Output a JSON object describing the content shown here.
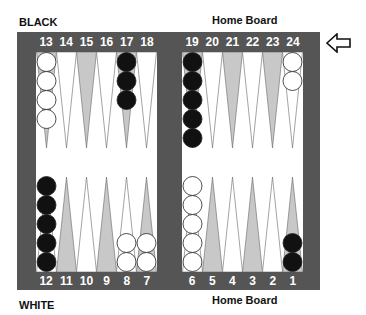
{
  "labels": {
    "top_left": "BLACK",
    "top_right": "Home Board",
    "bottom_left": "WHITE",
    "bottom_right": "Home Board"
  },
  "colors": {
    "frame": "#555555",
    "field": "#ffffff",
    "dark_point": "#c8c8c8",
    "light_point": "#ffffff",
    "black_checker": "#111111",
    "white_checker": "#ffffff"
  },
  "direction_arrow": "left-arrow-icon",
  "top_left_numbers": [
    "13",
    "14",
    "15",
    "16",
    "17",
    "18"
  ],
  "top_right_numbers": [
    "19",
    "20",
    "21",
    "22",
    "23",
    "24"
  ],
  "bottom_left_numbers": [
    "12",
    "11",
    "10",
    "9",
    "8",
    "7"
  ],
  "bottom_right_numbers": [
    "6",
    "5",
    "4",
    "3",
    "2",
    "1"
  ],
  "points": {
    "13": {
      "color": "white",
      "count": 4,
      "shade": "dark"
    },
    "14": {
      "color": null,
      "count": 0,
      "shade": "light"
    },
    "15": {
      "color": null,
      "count": 0,
      "shade": "dark"
    },
    "16": {
      "color": null,
      "count": 0,
      "shade": "light"
    },
    "17": {
      "color": "black",
      "count": 3,
      "shade": "dark"
    },
    "18": {
      "color": null,
      "count": 0,
      "shade": "light"
    },
    "19": {
      "color": "black",
      "count": 5,
      "shade": "dark"
    },
    "20": {
      "color": null,
      "count": 0,
      "shade": "light"
    },
    "21": {
      "color": null,
      "count": 0,
      "shade": "dark"
    },
    "22": {
      "color": null,
      "count": 0,
      "shade": "light"
    },
    "23": {
      "color": null,
      "count": 0,
      "shade": "dark"
    },
    "24": {
      "color": "white",
      "count": 2,
      "shade": "light"
    },
    "12": {
      "color": "black",
      "count": 5,
      "shade": "light"
    },
    "11": {
      "color": null,
      "count": 0,
      "shade": "dark"
    },
    "10": {
      "color": null,
      "count": 0,
      "shade": "light"
    },
    "9": {
      "color": null,
      "count": 0,
      "shade": "dark"
    },
    "8": {
      "color": "white",
      "count": 2,
      "shade": "light"
    },
    "7": {
      "color": "white",
      "count": 2,
      "shade": "dark"
    },
    "6": {
      "color": "white",
      "count": 5,
      "shade": "light"
    },
    "5": {
      "color": null,
      "count": 0,
      "shade": "dark"
    },
    "4": {
      "color": null,
      "count": 0,
      "shade": "light"
    },
    "3": {
      "color": null,
      "count": 0,
      "shade": "dark"
    },
    "2": {
      "color": null,
      "count": 0,
      "shade": "light"
    },
    "1": {
      "color": "black",
      "count": 2,
      "shade": "dark"
    }
  }
}
